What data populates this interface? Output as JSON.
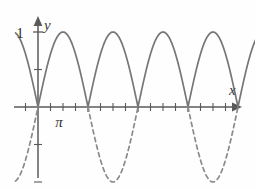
{
  "figure": {
    "title": "",
    "background_color": "#fefefe",
    "curve_color": "#767676",
    "dashed_curve_color": "#8a8a8a",
    "axis_color": "#5a5a5a"
  },
  "labels": {
    "y_axis": "y",
    "x_axis": "x",
    "y_one": "1",
    "x_pi": "π"
  },
  "chart_data": {
    "type": "line",
    "title": "",
    "xlabel": "x",
    "ylabel": "y",
    "xlim": [
      -0.45,
      4.55
    ],
    "ylim": [
      -1.45,
      1.25
    ],
    "grid": false,
    "legend": "none",
    "x_tick_labels": [
      "π"
    ],
    "x_tick_label_positions": [
      1
    ],
    "y_tick_labels": [
      "1"
    ],
    "y_tick_label_positions": [
      1
    ],
    "x_tick_step_in_pi": 0.25,
    "x_major_ticks_in_pi": [
      0,
      1,
      2,
      3,
      4
    ],
    "y_ticks": [
      1,
      0.5,
      -0.5,
      -1
    ],
    "series": [
      {
        "name": "y = |sin x|",
        "style": "solid",
        "color": "#767676",
        "formula": "abs(sin(x))",
        "x_domain_in_pi": [
          -0.45,
          4.45
        ],
        "sample_points_in_pi": [
          [
            -0.45,
            0.988
          ],
          [
            -0.4,
            0.951
          ],
          [
            -0.3,
            0.809
          ],
          [
            -0.2,
            0.588
          ],
          [
            -0.1,
            0.309
          ],
          [
            0,
            0
          ],
          [
            0.1,
            0.309
          ],
          [
            0.2,
            0.588
          ],
          [
            0.3,
            0.809
          ],
          [
            0.4,
            0.951
          ],
          [
            0.5,
            1
          ],
          [
            0.6,
            0.951
          ],
          [
            0.7,
            0.809
          ],
          [
            0.8,
            0.588
          ],
          [
            0.9,
            0.309
          ],
          [
            1,
            0
          ],
          [
            1.1,
            0.309
          ],
          [
            1.25,
            0.707
          ],
          [
            1.5,
            1
          ],
          [
            1.75,
            0.707
          ],
          [
            1.9,
            0.309
          ],
          [
            2,
            0
          ],
          [
            2.25,
            0.707
          ],
          [
            2.5,
            1
          ],
          [
            2.75,
            0.707
          ],
          [
            3,
            0
          ],
          [
            3.25,
            0.707
          ],
          [
            3.5,
            1
          ],
          [
            3.75,
            0.707
          ],
          [
            4,
            0
          ],
          [
            4.2,
            0.588
          ],
          [
            4.45,
            0.988
          ]
        ]
      },
      {
        "name": "y = sin x (negative arcs)",
        "style": "dashed",
        "color": "#8a8a8a",
        "formula": "sin(x)",
        "segments_in_pi": [
          [
            -0.45,
            0
          ],
          [
            1,
            2
          ],
          [
            3,
            4
          ]
        ],
        "sample_points_in_pi": [
          [
            -0.45,
            -0.988
          ],
          [
            -0.3,
            -0.809
          ],
          [
            -0.15,
            -0.454
          ],
          [
            0,
            0
          ],
          [
            1,
            0
          ],
          [
            1.25,
            -0.707
          ],
          [
            1.5,
            -1
          ],
          [
            1.75,
            -0.707
          ],
          [
            2,
            0
          ],
          [
            3,
            0
          ],
          [
            3.25,
            -0.707
          ],
          [
            3.5,
            -1
          ],
          [
            3.75,
            -0.707
          ],
          [
            4,
            0
          ]
        ]
      }
    ],
    "annotations": [
      {
        "text": "1",
        "x_in_pi": -0.12,
        "y": 1,
        "role": "y-axis value"
      },
      {
        "text": "π",
        "x_in_pi": 0.42,
        "y": -0.28,
        "role": "x-axis value"
      },
      {
        "text": "y",
        "x_in_pi": 0.1,
        "y": 1.28,
        "role": "axis name"
      },
      {
        "text": "x",
        "x_in_pi": 4.35,
        "y": 0.28,
        "role": "axis name"
      }
    ]
  }
}
